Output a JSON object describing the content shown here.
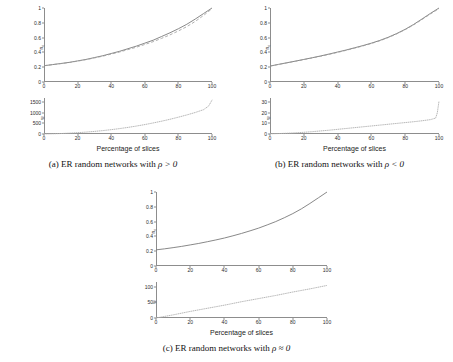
{
  "figure": {
    "shared": {
      "xlabel": "Percentage of slices",
      "xticks": [
        "0",
        "20",
        "40",
        "60",
        "80",
        "100"
      ],
      "xlim": [
        0,
        100
      ],
      "top_ylabel": "n",
      "top_ylabel_sub": "c",
      "bottom_ylabel": "w",
      "top_yticks": [
        "0",
        "0.2",
        "0.4",
        "0.6",
        "0.8",
        "1"
      ],
      "top_ylim": [
        0,
        1
      ],
      "colors": {
        "solid_curve": "#7a7a7a",
        "dashed_curve": "#9a9a9a",
        "dotted_curve": "#b0b0b0",
        "axis": "#8d8d8d",
        "text": "#2b2b2b"
      }
    },
    "subfigures": [
      {
        "id": "a",
        "caption_prefix": "(a) ER random networks with ",
        "caption_math": "ρ > 0",
        "bottom_yticks": [
          "0",
          "500",
          "1000",
          "1500"
        ],
        "bottom_ylim": [
          0,
          1700
        ]
      },
      {
        "id": "b",
        "caption_prefix": "(b) ER random networks with ",
        "caption_math": "ρ < 0",
        "bottom_yticks": [
          "0",
          "10",
          "20",
          "30"
        ],
        "bottom_ylim": [
          0,
          34
        ]
      },
      {
        "id": "c",
        "caption_prefix": "(c) ER random networks with ",
        "caption_math": "ρ ≈ 0",
        "bottom_yticks": [
          "0",
          "50",
          "100"
        ],
        "bottom_ylim": [
          0,
          115
        ]
      }
    ]
  },
  "chart_data": [
    {
      "type": "line",
      "panel": "a-top",
      "title": "",
      "xlabel": "Percentage of slices",
      "ylabel": "n_c",
      "xlim": [
        0,
        100
      ],
      "ylim": [
        0,
        1
      ],
      "xticks": [
        0,
        20,
        40,
        60,
        80,
        100
      ],
      "yticks": [
        0,
        0.2,
        0.4,
        0.6,
        0.8,
        1
      ],
      "grid": false,
      "legend": "none",
      "x": [
        0,
        5,
        10,
        15,
        20,
        25,
        30,
        35,
        40,
        45,
        50,
        55,
        60,
        65,
        70,
        75,
        80,
        85,
        90,
        95,
        100
      ],
      "series": [
        {
          "name": "solid",
          "style": "solid",
          "values": [
            0.22,
            0.235,
            0.25,
            0.265,
            0.285,
            0.305,
            0.33,
            0.355,
            0.385,
            0.415,
            0.45,
            0.485,
            0.525,
            0.565,
            0.615,
            0.665,
            0.72,
            0.78,
            0.85,
            0.925,
            1.0
          ]
        },
        {
          "name": "dashed",
          "style": "dashed",
          "values": [
            0.22,
            0.234,
            0.248,
            0.263,
            0.282,
            0.302,
            0.325,
            0.349,
            0.377,
            0.405,
            0.438,
            0.47,
            0.507,
            0.545,
            0.59,
            0.637,
            0.69,
            0.748,
            0.818,
            0.9,
            0.99
          ]
        }
      ]
    },
    {
      "type": "line",
      "panel": "a-bottom",
      "title": "",
      "xlabel": "Percentage of slices",
      "ylabel": "w",
      "xlim": [
        0,
        100
      ],
      "ylim": [
        0,
        1700
      ],
      "xticks": [
        0,
        20,
        40,
        60,
        80,
        100
      ],
      "yticks": [
        0,
        500,
        1000,
        1500
      ],
      "grid": false,
      "legend": "none",
      "x": [
        0,
        5,
        10,
        15,
        20,
        25,
        30,
        35,
        40,
        45,
        50,
        55,
        60,
        65,
        70,
        75,
        80,
        85,
        90,
        95,
        98,
        100
      ],
      "series": [
        {
          "name": "dotted",
          "style": "dotted",
          "values": [
            2,
            10,
            22,
            40,
            62,
            90,
            122,
            160,
            205,
            255,
            312,
            375,
            445,
            522,
            605,
            695,
            795,
            900,
            1015,
            1150,
            1320,
            1600
          ]
        }
      ]
    },
    {
      "type": "line",
      "panel": "b-top",
      "title": "",
      "xlabel": "Percentage of slices",
      "ylabel": "n_c",
      "xlim": [
        0,
        100
      ],
      "ylim": [
        0,
        1
      ],
      "xticks": [
        0,
        20,
        40,
        60,
        80,
        100
      ],
      "yticks": [
        0,
        0.2,
        0.4,
        0.6,
        0.8,
        1
      ],
      "grid": false,
      "legend": "none",
      "x": [
        0,
        5,
        10,
        15,
        20,
        25,
        30,
        35,
        40,
        45,
        50,
        55,
        60,
        65,
        70,
        75,
        80,
        85,
        90,
        95,
        100
      ],
      "series": [
        {
          "name": "solid",
          "style": "solid",
          "values": [
            0.215,
            0.238,
            0.26,
            0.282,
            0.305,
            0.328,
            0.352,
            0.378,
            0.405,
            0.432,
            0.462,
            0.492,
            0.525,
            0.562,
            0.605,
            0.655,
            0.712,
            0.778,
            0.852,
            0.928,
            1.0
          ]
        },
        {
          "name": "dashed",
          "style": "dashed",
          "values": [
            0.215,
            0.237,
            0.258,
            0.28,
            0.302,
            0.325,
            0.348,
            0.373,
            0.4,
            0.427,
            0.457,
            0.487,
            0.52,
            0.557,
            0.6,
            0.65,
            0.707,
            0.772,
            0.845,
            0.92,
            0.992
          ]
        }
      ]
    },
    {
      "type": "line",
      "panel": "b-bottom",
      "title": "",
      "xlabel": "Percentage of slices",
      "ylabel": "w",
      "xlim": [
        0,
        100
      ],
      "ylim": [
        0,
        34
      ],
      "xticks": [
        0,
        20,
        40,
        60,
        80,
        100
      ],
      "yticks": [
        0,
        10,
        20,
        30
      ],
      "grid": false,
      "legend": "none",
      "x": [
        0,
        5,
        10,
        15,
        20,
        25,
        30,
        35,
        40,
        45,
        50,
        55,
        60,
        65,
        70,
        75,
        80,
        85,
        90,
        95,
        98,
        99,
        100
      ],
      "series": [
        {
          "name": "dotted",
          "style": "dotted",
          "values": [
            0.2,
            0.4,
            0.7,
            1.1,
            1.6,
            2.2,
            2.9,
            3.6,
            4.4,
            5.2,
            6.0,
            6.8,
            7.6,
            8.4,
            9.2,
            10.0,
            10.8,
            11.6,
            12.5,
            13.6,
            15.0,
            20.0,
            31.0
          ]
        }
      ]
    },
    {
      "type": "line",
      "panel": "c-top",
      "title": "",
      "xlabel": "Percentage of slices",
      "ylabel": "n_c",
      "xlim": [
        0,
        100
      ],
      "ylim": [
        0,
        1
      ],
      "xticks": [
        0,
        20,
        40,
        60,
        80,
        100
      ],
      "yticks": [
        0,
        0.2,
        0.4,
        0.6,
        0.8,
        1
      ],
      "grid": false,
      "legend": "none",
      "x": [
        0,
        5,
        10,
        15,
        20,
        25,
        30,
        35,
        40,
        45,
        50,
        55,
        60,
        65,
        70,
        75,
        80,
        85,
        90,
        95,
        100
      ],
      "series": [
        {
          "name": "solid",
          "style": "solid",
          "values": [
            0.218,
            0.232,
            0.248,
            0.265,
            0.285,
            0.305,
            0.328,
            0.352,
            0.378,
            0.408,
            0.44,
            0.475,
            0.512,
            0.555,
            0.6,
            0.652,
            0.708,
            0.772,
            0.845,
            0.922,
            1.0
          ]
        }
      ]
    },
    {
      "type": "line",
      "panel": "c-bottom",
      "title": "",
      "xlabel": "Percentage of slices",
      "ylabel": "w",
      "xlim": [
        0,
        100
      ],
      "ylim": [
        0,
        115
      ],
      "xticks": [
        0,
        20,
        40,
        60,
        80,
        100
      ],
      "yticks": [
        0,
        50,
        100
      ],
      "grid": false,
      "legend": "none",
      "x": [
        0,
        10,
        20,
        30,
        40,
        50,
        60,
        70,
        80,
        90,
        100
      ],
      "series": [
        {
          "name": "dotted",
          "style": "dotted",
          "values": [
            0,
            10,
            21,
            31,
            41,
            52,
            62,
            72,
            83,
            93,
            104
          ]
        }
      ]
    }
  ]
}
